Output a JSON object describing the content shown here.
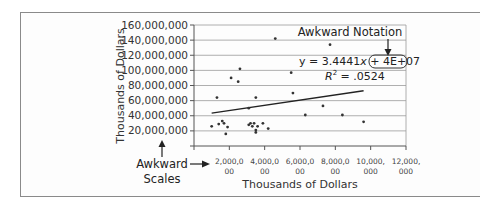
{
  "chart_data": {
    "type": "scatter",
    "title": "",
    "xlabel": "Thousands of Dollars",
    "ylabel": "Thousands of Dollars",
    "xlim": [
      0,
      12000000
    ],
    "ylim": [
      0,
      160000000
    ],
    "grid": "horizontal",
    "legend": "none",
    "x_ticks": [
      {
        "value": 2000000,
        "line1": "2,000,0",
        "line2": "00"
      },
      {
        "value": 4000000,
        "line1": "4,000,0",
        "line2": "00"
      },
      {
        "value": 6000000,
        "line1": "6,000,0",
        "line2": "00"
      },
      {
        "value": 8000000,
        "line1": "8,000,0",
        "line2": "00"
      },
      {
        "value": 10000000,
        "line1": "10,000,",
        "line2": "000"
      },
      {
        "value": 12000000,
        "line1": "12,000,",
        "line2": "000"
      }
    ],
    "y_ticks": [
      {
        "value": 20000000,
        "label": "20,000,000"
      },
      {
        "value": 40000000,
        "label": "40,000,000"
      },
      {
        "value": 60000000,
        "label": "60,000,000"
      },
      {
        "value": 80000000,
        "label": "80,000,000"
      },
      {
        "value": 100000000,
        "label": "100,000,000"
      },
      {
        "value": 120000000,
        "label": "120,000,000"
      },
      {
        "value": 140000000,
        "label": "140,000,000"
      },
      {
        "value": 160000000,
        "label": "160,000,000"
      }
    ],
    "points": [
      [
        1000000,
        26000000
      ],
      [
        1300000,
        64000000
      ],
      [
        1400000,
        29000000
      ],
      [
        1600000,
        33000000
      ],
      [
        1700000,
        30000000
      ],
      [
        1800000,
        16000000
      ],
      [
        1900000,
        25000000
      ],
      [
        2100000,
        90000000
      ],
      [
        2500000,
        85000000
      ],
      [
        2600000,
        102000000
      ],
      [
        3100000,
        50000000
      ],
      [
        3100000,
        28000000
      ],
      [
        3200000,
        30000000
      ],
      [
        3300000,
        26000000
      ],
      [
        3400000,
        30000000
      ],
      [
        3500000,
        21000000
      ],
      [
        3500000,
        18000000
      ],
      [
        3500000,
        64000000
      ],
      [
        3600000,
        26000000
      ],
      [
        3900000,
        30000000
      ],
      [
        4200000,
        23000000
      ],
      [
        4600000,
        142000000
      ],
      [
        5500000,
        97000000
      ],
      [
        5600000,
        70000000
      ],
      [
        6300000,
        41000000
      ],
      [
        7300000,
        53000000
      ],
      [
        7700000,
        134000000
      ],
      [
        8400000,
        41000000
      ],
      [
        9600000,
        32000000
      ]
    ],
    "trendline": {
      "type": "linear",
      "slope": 3.4441,
      "intercept": 40000000,
      "x_start": 1000000,
      "x_end": 9600000,
      "equation": "y = 3.4441x + 4E+07",
      "r_squared": "R² = .0524"
    },
    "annotations": [
      {
        "text": "Awkward Notation",
        "points_to": "4E+07"
      },
      {
        "text_line1": "Awkward",
        "text_line2": "Scales",
        "points_to": "axis tick labels"
      }
    ]
  },
  "labels": {
    "eq_prefix": "y = 3.4441",
    "eq_x": "x",
    "eq_plus": " + ",
    "eq_highlight": "4E+07",
    "r2_R": "R",
    "r2_sup": "2",
    "r2_value": " = .0524",
    "awkward_notation": "Awkward Notation",
    "awkward_line1": "Awkward",
    "awkward_line2": "Scales",
    "x_title": "Thousands of Dollars",
    "y_title": "Thousands of Dollars"
  },
  "colors": {
    "grid": "#9a9a9a",
    "axis": "#555555",
    "point": "#333333",
    "trend": "#222222",
    "frame": "#8a8a8a"
  }
}
